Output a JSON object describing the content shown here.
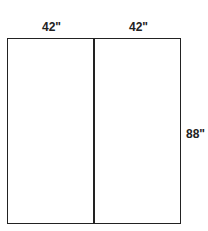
{
  "diagram": {
    "labels": {
      "left_width": "42\"",
      "right_width": "42\"",
      "height": "88\""
    },
    "panels": [
      {
        "name": "left-panel",
        "width": "42\""
      },
      {
        "name": "right-panel",
        "width": "42\""
      }
    ],
    "colors": {
      "line": "#222222",
      "background": "#ffffff"
    }
  }
}
